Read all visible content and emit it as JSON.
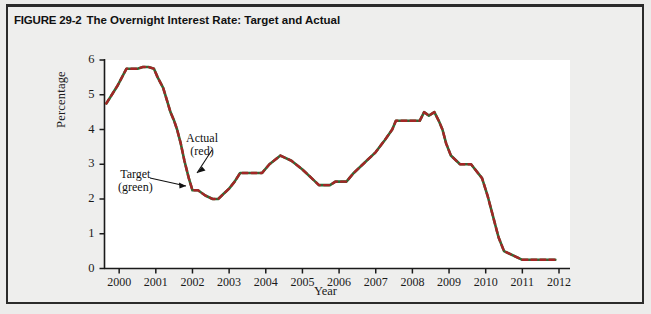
{
  "figure": {
    "number": "FIGURE 29-2",
    "title": "The Overnight Interest Rate: Target and Actual"
  },
  "axes": {
    "ylabel": "Percentage",
    "xlabel": "Year",
    "yticks": [
      "0",
      "1",
      "2",
      "3",
      "4",
      "5",
      "6"
    ],
    "xticks": [
      "2000",
      "2001",
      "2002",
      "2003",
      "2004",
      "2005",
      "2006",
      "2007",
      "2008",
      "2009",
      "2010",
      "2011",
      "2012"
    ]
  },
  "annotations": {
    "target": {
      "line1": "Target",
      "line2": "(green)"
    },
    "actual": {
      "line1": "Actual",
      "line2": "(red)"
    }
  },
  "colors": {
    "target_line": "#2f6b34",
    "actual_line": "#a32626",
    "axis": "#1a1a1a",
    "plot_bg": "#ffffff",
    "figure_bg": "#ececeb",
    "frame": "#2b2b2b"
  },
  "chart_data": {
    "type": "line",
    "title": "The Overnight Interest Rate: Target and Actual",
    "xlabel": "Year",
    "ylabel": "Percentage",
    "xlim": [
      1999.6,
      2012.3
    ],
    "ylim": [
      0,
      6
    ],
    "grid": false,
    "legend": "annotations-inline",
    "series": [
      {
        "name": "Target (green)",
        "color": "#2f6b34",
        "x": [
          1999.65,
          1999.8,
          1999.95,
          2000.05,
          2000.2,
          2000.35,
          2000.5,
          2000.65,
          2000.8,
          2000.95,
          2001.05,
          2001.2,
          2001.3,
          2001.4,
          2001.5,
          2001.58,
          2001.68,
          2001.78,
          2001.9,
          2002.0,
          2002.15,
          2002.35,
          2002.55,
          2002.7,
          2002.85,
          2003.0,
          2003.15,
          2003.3,
          2003.45,
          2003.6,
          2003.75,
          2003.9,
          2004.1,
          2004.4,
          2004.7,
          2005.0,
          2005.25,
          2005.45,
          2005.6,
          2005.75,
          2005.9,
          2006.05,
          2006.2,
          2006.4,
          2006.7,
          2007.0,
          2007.25,
          2007.45,
          2007.55,
          2007.65,
          2007.8,
          2007.95,
          2008.08,
          2008.2,
          2008.32,
          2008.45,
          2008.6,
          2008.72,
          2008.82,
          2008.92,
          2009.05,
          2009.3,
          2009.6,
          2009.9,
          2010.05,
          2010.2,
          2010.35,
          2010.5,
          2011.0,
          2011.5,
          2011.9
        ],
        "y": [
          4.75,
          5.0,
          5.25,
          5.45,
          5.75,
          5.75,
          5.75,
          5.8,
          5.8,
          5.75,
          5.5,
          5.2,
          4.85,
          4.5,
          4.25,
          4.0,
          3.6,
          3.1,
          2.6,
          2.25,
          2.25,
          2.1,
          2.0,
          2.0,
          2.15,
          2.3,
          2.5,
          2.75,
          2.75,
          2.75,
          2.75,
          2.75,
          3.0,
          3.25,
          3.1,
          2.85,
          2.6,
          2.4,
          2.4,
          2.4,
          2.5,
          2.5,
          2.5,
          2.75,
          3.05,
          3.35,
          3.7,
          4.0,
          4.25,
          4.25,
          4.25,
          4.25,
          4.25,
          4.25,
          4.5,
          4.4,
          4.5,
          4.25,
          4.0,
          3.6,
          3.25,
          3.0,
          3.0,
          2.6,
          2.1,
          1.5,
          0.9,
          0.5,
          0.25,
          0.25,
          0.25
        ]
      },
      {
        "name": "Actual (red)",
        "color": "#a32626",
        "note": "Actual tracks the target almost exactly; drawn as an overlapping dashed line",
        "x": [
          1999.65,
          2000.5,
          2001.5,
          2002.55,
          2003.45,
          2004.4,
          2005.45,
          2006.4,
          2007.55,
          2008.45,
          2009.3,
          2010.35,
          2011.5,
          2011.9
        ],
        "y": [
          4.75,
          5.75,
          4.25,
          2.0,
          2.75,
          3.25,
          2.4,
          2.75,
          4.25,
          4.5,
          3.0,
          0.9,
          1.0,
          1.0
        ]
      }
    ],
    "key_points": [
      {
        "year": 1999.7,
        "value": 4.75,
        "label": "start"
      },
      {
        "year": 2000.6,
        "value": 5.8,
        "label": "peak"
      },
      {
        "year": 2001.9,
        "value": 2.0,
        "label": "trough after 2001"
      },
      {
        "year": 2002.9,
        "value": 2.75,
        "label": "plateau"
      },
      {
        "year": 2003.3,
        "value": 3.25,
        "label": "local peak"
      },
      {
        "year": 2004.3,
        "value": 2.4,
        "label": "low plateau"
      },
      {
        "year": 2006.3,
        "value": 4.25,
        "label": "plateau high"
      },
      {
        "year": 2007.4,
        "value": 4.5,
        "label": "peak 2007"
      },
      {
        "year": 2009.2,
        "value": 0.25,
        "label": "crisis floor"
      },
      {
        "year": 2010.5,
        "value": 1.0,
        "label": "post-crisis level"
      },
      {
        "year": 2012.0,
        "value": 1.0,
        "label": "end"
      }
    ]
  },
  "caption": {
    "text": ""
  }
}
